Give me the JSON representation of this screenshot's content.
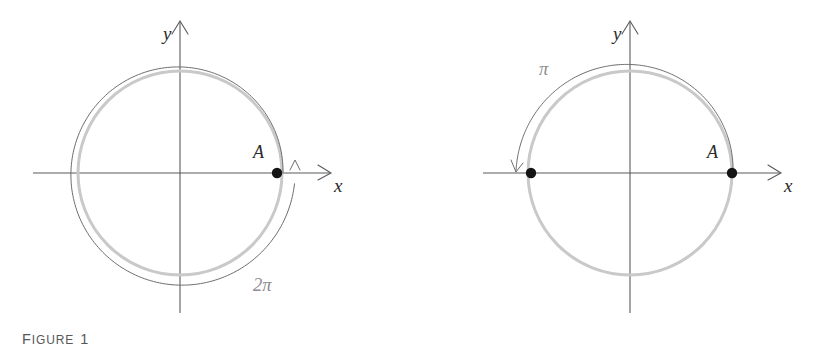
{
  "page": {
    "width": 820,
    "height": 353,
    "background": "#ffffff",
    "content_type": "trigonometry-unit-circle-figures"
  },
  "colors": {
    "axis": "#5a5a5c",
    "arc_dark": "#6e6e70",
    "circle_gray": "#c9c9c9",
    "point_fill": "#141414",
    "label_text": "#2b2b2b",
    "caption_text": "#58585a"
  },
  "figures": [
    {
      "id": "figure-1",
      "caption_lead": "F",
      "caption_rest": "IGURE",
      "caption_number": "1",
      "caption_full": "FIGURE 1",
      "origin": {
        "x": 180,
        "y": 173
      },
      "circle_radius": 102,
      "arc_radius": 112,
      "axis_labels": {
        "y": "y",
        "x": "x"
      },
      "point_labels": [
        {
          "name": "A",
          "label": "A",
          "x": 277,
          "y": 173
        }
      ],
      "angle_label": {
        "text": "2π",
        "value": "2π",
        "x": 254,
        "y": 285
      },
      "arrow_direction": "counterclockwise",
      "sweep_turns": 1.0,
      "description": "Unit circle with a full 2 pi revolution arc starting at point A and ending with an upward arrowhead on the positive x axis."
    },
    {
      "id": "figure-2",
      "caption_lead": "F",
      "caption_rest": "IGURE",
      "caption_number": "2",
      "caption_full": "FIGURE 2",
      "origin": {
        "x": 630,
        "y": 173
      },
      "circle_radius": 102,
      "arc_radius": 112,
      "axis_labels": {
        "y": "y",
        "x": "x"
      },
      "point_labels": [
        {
          "name": "A",
          "label": "A",
          "x": 732,
          "y": 173
        },
        {
          "name": "terminal",
          "label": "",
          "x": 528,
          "y": 173
        }
      ],
      "angle_label": {
        "text": "π",
        "value": "π",
        "x": 546,
        "y": 68
      },
      "arrow_direction": "counterclockwise",
      "sweep_turns": 0.5,
      "description": "Unit circle with a half revolution pi arc starting at point A sweeping over the top and ending with a downward arrowhead on the negative x axis."
    }
  ],
  "chart_data": {
    "type": "diagram",
    "title": "",
    "subtitle": "",
    "panels": [
      {
        "name": "FIGURE 1",
        "angle": "2π",
        "angle_radians": 6.283185,
        "start_point": "A",
        "start_angle_deg": 0,
        "end_angle_deg": 360,
        "terminal_point": "A",
        "circle_center": [
          180,
          173
        ],
        "circle_radius_px": 102,
        "arc_radius_px": 112,
        "marked_points": [
          {
            "label": "A",
            "coords_px": [
              277,
              173
            ],
            "unit_circle_coords": [
              1,
              0
            ]
          }
        ],
        "axes": [
          "x",
          "y"
        ],
        "direction": "counterclockwise"
      },
      {
        "name": "FIGURE 2",
        "angle": "π",
        "angle_radians": 3.141593,
        "start_point": "A",
        "start_angle_deg": 0,
        "end_angle_deg": 180,
        "terminal_point": "(-1, 0)",
        "circle_center": [
          630,
          173
        ],
        "circle_radius_px": 102,
        "arc_radius_px": 112,
        "marked_points": [
          {
            "label": "A",
            "coords_px": [
              732,
              173
            ],
            "unit_circle_coords": [
              1,
              0
            ]
          },
          {
            "label": "",
            "coords_px": [
              528,
              173
            ],
            "unit_circle_coords": [
              -1,
              0
            ]
          }
        ],
        "axes": [
          "x",
          "y"
        ],
        "direction": "counterclockwise"
      }
    ],
    "xlabel": "x",
    "ylabel": "y",
    "grid": false,
    "legend": "none"
  }
}
